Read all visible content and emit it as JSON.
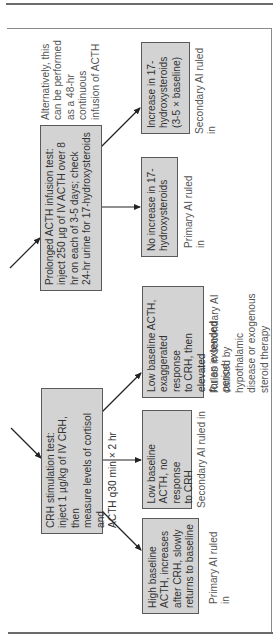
{
  "diagram": {
    "orientation": "rotated-90-ccw",
    "colors": {
      "box_fill": "#d3d3d3",
      "box_border": "#5a5a5a",
      "text": "#333333",
      "label_text": "#555555",
      "arrow": "#222222",
      "rule": "#6b6b6b"
    },
    "sections": {
      "prolonged_acth": {
        "test_box": {
          "text": "Prolonged ACTH infusion test:\ninject 250 µg of IV ACTH over 8\nhr on each of 3-5 days; check\n24-hr urine for 17-hydroxysteroids"
        },
        "note": {
          "text": "Alternatively, this\ncan be performed\nas a 48-hr\ncontinuous\ninfusion of ACTH"
        },
        "outcomes": [
          {
            "box_text": "No increase in 17-\nhydroxysteroids",
            "label": "Primary AI ruled in"
          },
          {
            "box_text": "Increase in 17-\nhydroxysteroids\n(3-5 × baseline)",
            "label": "Secondary AI ruled in"
          }
        ]
      },
      "crh_stimulation": {
        "test_box": {
          "text": "CRH stimulation test:\ninject 1 µg/kg of IV CRH, then\nmeasure levels of cortisol and\nACTH q30 min × 2 hr"
        },
        "outcomes": [
          {
            "box_text": "High baseline\nACTH, increases\nafter CRH, slowly\nreturns to baseline",
            "label": "Primary AI ruled in"
          },
          {
            "box_text": "Low baseline\nACTH, no response\nto CRH",
            "label": "Secondary AI ruled in"
          },
          {
            "box_text": "Low baseline ACTH,\nexaggerated response\nto CRH, then elevated\nfor an extended period",
            "label": "Rules in secondary AI\ncaused by hypothalamic\ndisease or exogenous\nsteroid therapy"
          }
        ]
      }
    }
  }
}
